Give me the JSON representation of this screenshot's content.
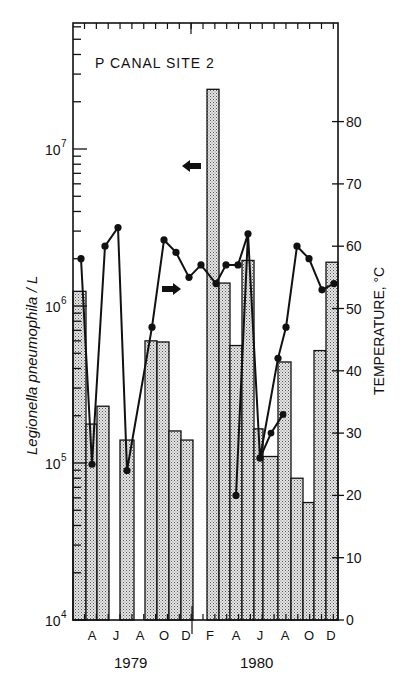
{
  "chart_data": {
    "type": "bar",
    "title": "P CANAL SITE 2",
    "xlabel": "",
    "ylabel": "Legionella pneumophila / L",
    "y2label": "TEMPERATURE, °C",
    "yscale": "log",
    "ylim": [
      10000,
      50000000
    ],
    "y2lim": [
      0,
      95
    ],
    "grid": false,
    "y_ticks": [
      {
        "label": "10",
        "exp": "4",
        "value": 10000
      },
      {
        "label": "10",
        "exp": "5",
        "value": 100000
      },
      {
        "label": "10",
        "exp": "6",
        "value": 1000000
      },
      {
        "label": "10",
        "exp": "7",
        "value": 10000000
      }
    ],
    "y2_ticks": [
      "0",
      "10",
      "20",
      "30",
      "40",
      "50",
      "60",
      "70",
      "80"
    ],
    "month_ticks": [
      "A",
      "J",
      "A",
      "O",
      "D",
      "F",
      "A",
      "J",
      "A",
      "O",
      "D"
    ],
    "years": [
      "1979",
      "1980"
    ],
    "arrows": [
      {
        "direction": "left",
        "meaning": "bars use left axis"
      },
      {
        "direction": "right",
        "meaning": "line uses right axis"
      }
    ],
    "series": [
      {
        "name": "Legionella pneumophila / L (bars)",
        "axis": "left",
        "bars": [
          {
            "period": "Feb 1979",
            "value": 1240000
          },
          {
            "period": "Mar-Apr 1979",
            "value": 177000
          },
          {
            "period": "Apr-May 1979",
            "value": 230000
          },
          {
            "period": "May-Jun 1979",
            "value": null
          },
          {
            "period": "Jun-Jul 1979",
            "value": 140000
          },
          {
            "period": "Jul-Aug 1979",
            "value": null
          },
          {
            "period": "Aug-Sep 1979",
            "value": 600000
          },
          {
            "period": "Sep-Oct 1979",
            "value": 590000
          },
          {
            "period": "Oct-Nov 1979",
            "value": 160000
          },
          {
            "period": "Nov-Dec 1979",
            "value": 140000
          },
          {
            "period": "Dec 1979-Jan 1980",
            "value": null
          },
          {
            "period": "Jan-Feb 1980",
            "value": 24000000
          },
          {
            "period": "Feb-Mar 1980",
            "value": 1400000
          },
          {
            "period": "Mar-Apr 1980",
            "value": 560000
          },
          {
            "period": "Apr-May 1980",
            "value": 1950000
          },
          {
            "period": "May-Jun 1980",
            "value": 165000
          },
          {
            "period": "Jun-Jul 1980",
            "value": 110000
          },
          {
            "period": "Jul-Aug 1980",
            "value": 440000
          },
          {
            "period": "Aug-Sep 1980",
            "value": 80000
          },
          {
            "period": "Sep-Oct 1980",
            "value": 56000
          },
          {
            "period": "Oct-Nov 1980",
            "value": 520000
          },
          {
            "period": "Nov-Dec 1980",
            "value": 1900000
          }
        ]
      },
      {
        "name": "Temperature °C (line)",
        "axis": "right",
        "points": [
          58,
          25,
          60,
          63,
          24,
          47,
          61,
          59,
          55,
          57,
          54,
          57,
          57,
          62,
          20,
          26,
          42,
          47,
          60,
          58,
          53,
          54
        ],
        "branch_points": [
          26,
          30,
          33
        ]
      }
    ]
  }
}
